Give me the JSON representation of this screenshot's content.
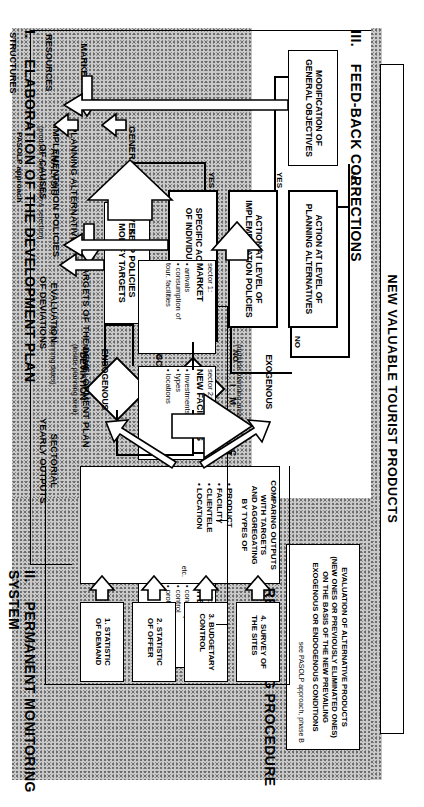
{
  "diagram": {
    "title_banner": "NEW VALUABLE TOURIST PRODUCTS",
    "corner_label": "PASOLP approach",
    "sections": {
      "s1": {
        "num": "I.",
        "title": "ELABORATION OF THE DEVELOPMENT PLAN"
      },
      "s2": {
        "num": "II.",
        "title": "PERMANENT MONITORING SYSTEM"
      },
      "s3": {
        "num": "III.",
        "title": "FEED-BACK CORRECTIONS"
      },
      "s4": {
        "num": "IV.",
        "title": "RE-PLANNING PROCEDURE"
      }
    },
    "plan": {
      "inputs": [
        "MARKET",
        "RESOURCES",
        "STRUCTURES"
      ],
      "general_objectives": "GENERAL OBJECTIVES",
      "planning_alternatives": "PLANNING ALTERNATIVES",
      "planning_alternatives_sub": "(products' determination & selection)",
      "implementation_policies": "IMPLEMENTATION POLICIES",
      "targets_title": "TARGETS OF THE DEVELOPMENT PLAN",
      "targets_sub": "(by planning dates)",
      "impacts_label": "I  M  P  A  C  T  S",
      "sectors": [
        {
          "num": "sector 1:",
          "name": "MARKET",
          "items": [
            "arrivals",
            "consumption of\ntour. facilities"
          ]
        },
        {
          "num": "sector 2:",
          "name": "NEW FACILITIES",
          "items": [
            "investments",
            "types",
            "locations"
          ]
        },
        {
          "num": "sector 3:",
          "name": "TOUR. INDUSTRY",
          "items": [
            "transport",
            "accommodation",
            "other services"
          ]
        },
        {
          "num": "sector 4:",
          "name": "SITES",
          "items": [
            "consumption",
            "control",
            "protection"
          ]
        }
      ]
    },
    "monitoring": {
      "sectorial_outputs_title": "SECTORIAL\nYEARLY OUTPUTS",
      "evaluation_title": "EVALUATION\nOF DEVIATIONS",
      "analysis_title": "ANALYSIS\nOF CAUSES",
      "statistics": [
        "1.  STATISTIC\n     OF DEMAND",
        "2.  STATISTIC\n     OF OFFER",
        "3.  BUDGETARY\n     CONTROL",
        "4.  SURVEY OF\n     THE SITES"
      ],
      "comparing_title": "COMPARING OUTPUTS\nWITH TARGETS\nAND AGGREGATING\nBY TYPES OF",
      "comparing_items": [
        "PRODUCT",
        "FACILITY",
        "CLIENTELE",
        "LOCATION"
      ],
      "etc": "etc.",
      "exogenous": "EXOGENOUS",
      "exogenous_sub": "(outside planning area)",
      "endogenous": "ENDOGENOUS",
      "endogenous_sub": "(inside planning area)"
    },
    "feedback": {
      "modification": "MODIFICATION OF\nGENERAL OBJECTIVES",
      "action_alternatives": "ACTION AT LEVEL OF\nPLANNING ALTERNATIVES",
      "action_policies": "ACTION AT LEVEL OF\nIMPLEMENTATION POLICIES",
      "specific_action": "SPECIFIC ACTION AT LEVEL\nOF INDIVIDUAL DEVIATIONS",
      "keep_policies": "KEEP POLICIES\nMODIFY TARGETS",
      "decision_acceptable": "ACCEPTABLE",
      "decision_deviation": "DEVIATION",
      "yes": "YES",
      "no": "NO",
      "major": "MAJOR",
      "minor": "MINOR"
    },
    "replanning": {
      "body": "EVALUATION OF ALTERNATIVE PRODUCTS\n(NEW ONES OR PREVIOUSLY ELIMINATED ONES)\nON THE BASIS OF THE NEW PREVAILING\nEXOGENOUS OR ENDOGENOUS CONDITIONS",
      "note": "see PASOLP approach, phase B"
    }
  }
}
